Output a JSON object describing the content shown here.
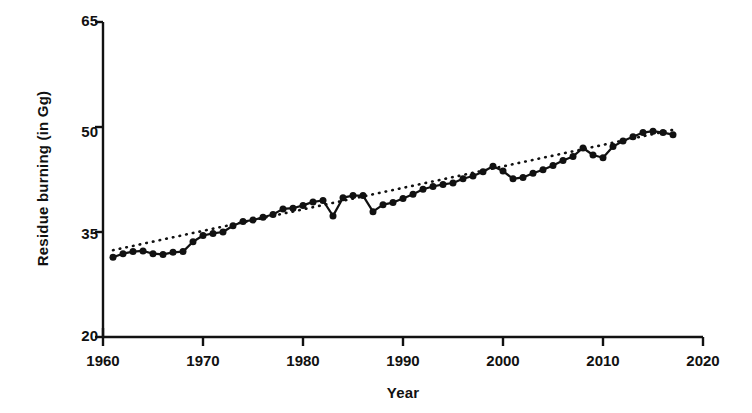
{
  "chart_data": {
    "type": "line",
    "title": "",
    "xlabel": "Year",
    "ylabel": "Residue burning (in Gg)",
    "xlim": [
      1960,
      2020
    ],
    "ylim": [
      20,
      65
    ],
    "xticks": [
      1960,
      1970,
      1980,
      1990,
      2000,
      2010,
      2020
    ],
    "yticks": [
      20,
      35,
      50,
      65
    ],
    "grid": false,
    "legend": "none",
    "marker": "filled-circle",
    "line_color": "#111111",
    "trend_style": "dotted",
    "x": [
      1961,
      1962,
      1963,
      1964,
      1965,
      1966,
      1967,
      1968,
      1969,
      1970,
      1971,
      1972,
      1973,
      1974,
      1975,
      1976,
      1977,
      1978,
      1979,
      1980,
      1981,
      1982,
      1983,
      1984,
      1985,
      1986,
      1987,
      1988,
      1989,
      1990,
      1991,
      1992,
      1993,
      1994,
      1995,
      1996,
      1997,
      1998,
      1999,
      2000,
      2001,
      2002,
      2003,
      2004,
      2005,
      2006,
      2007,
      2008,
      2009,
      2010,
      2011,
      2012,
      2013,
      2014,
      2015,
      2016,
      2017
    ],
    "series": [
      {
        "name": "Residue burning",
        "values": [
          31.4,
          31.9,
          32.2,
          32.3,
          31.9,
          31.8,
          32.1,
          32.2,
          33.6,
          34.5,
          34.8,
          35.0,
          35.9,
          36.5,
          36.7,
          37.1,
          37.5,
          38.3,
          38.4,
          38.8,
          39.3,
          39.5,
          37.3,
          39.9,
          40.2,
          40.2,
          37.9,
          38.9,
          39.2,
          39.8,
          40.4,
          41.1,
          41.5,
          41.8,
          42.0,
          42.6,
          43.0,
          43.6,
          44.4,
          43.7,
          42.6,
          42.8,
          43.4,
          43.9,
          44.5,
          45.2,
          45.8,
          47.0,
          46.0,
          45.6,
          47.2,
          48.0,
          48.6,
          49.2,
          49.4,
          49.2,
          48.9
        ]
      }
    ],
    "trendline": {
      "name": "Linear trend",
      "x": [
        1961,
        2017
      ],
      "y": [
        32.4,
        49.6
      ]
    }
  },
  "axis": {
    "y_tick_labels": [
      "65",
      "50",
      "35",
      "20"
    ],
    "x_tick_labels": [
      "1960",
      "1970",
      "1980",
      "1990",
      "2000",
      "2010",
      "2020"
    ]
  }
}
